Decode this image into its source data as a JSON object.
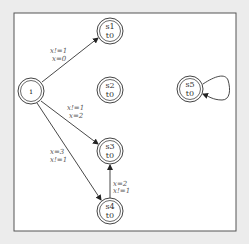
{
  "diagram": {
    "type": "state-machine",
    "frame": {
      "x": 14,
      "y": 13,
      "w": 222,
      "h": 218,
      "stroke": "#555555",
      "fill": "#ffffff"
    },
    "nodes": [
      {
        "id": "i",
        "line1": "i",
        "line2": "",
        "cx": 31,
        "cy": 91
      },
      {
        "id": "s1",
        "line1": "s1",
        "line2": "t0",
        "cx": 110,
        "cy": 31
      },
      {
        "id": "s2",
        "line1": "s2",
        "line2": "t0",
        "cx": 110,
        "cy": 90
      },
      {
        "id": "s3",
        "line1": "s3",
        "line2": "t0",
        "cx": 110,
        "cy": 151
      },
      {
        "id": "s4",
        "line1": "s4",
        "line2": "t0",
        "cx": 110,
        "cy": 211
      },
      {
        "id": "s5",
        "line1": "s5",
        "line2": "t0",
        "cx": 190,
        "cy": 89
      }
    ],
    "edges": [
      {
        "from": "i",
        "to": "s1",
        "label1": "x!=1",
        "label2": "x=0"
      },
      {
        "from": "i",
        "to": "s3",
        "label1": "x!=1",
        "label2": "x=2"
      },
      {
        "from": "i",
        "to": "s4",
        "label1": "x=3",
        "label2": "x!=1"
      },
      {
        "from": "s4",
        "to": "s3",
        "label1": "x=2",
        "label2": "x!=1"
      },
      {
        "from": "s5",
        "to": "s5",
        "label1": "",
        "label2": ""
      }
    ]
  }
}
